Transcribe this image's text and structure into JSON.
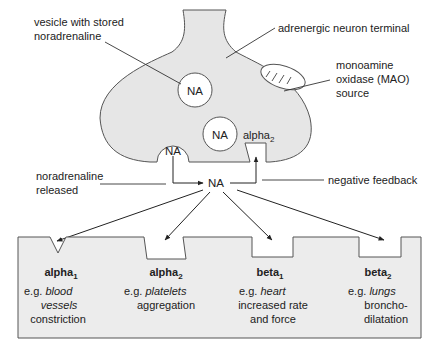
{
  "colors": {
    "fill_gray": "#e6e6e6",
    "stroke": "#555555",
    "text": "#222222",
    "background": "#ffffff"
  },
  "neuron": {
    "terminal_label": "adrenergic neuron terminal",
    "vesicle_label_line1": "vesicle with stored",
    "vesicle_label_line2": "noradrenaline",
    "mao_label_line1": "monoamine",
    "mao_label_line2": "oxidase (MAO)",
    "mao_label_line3": "source",
    "vesicles": [
      {
        "label": "NA"
      },
      {
        "label": "NA"
      },
      {
        "label": "NA"
      }
    ],
    "presynaptic_receptor": {
      "name": "alpha",
      "subscript": "2"
    }
  },
  "synapse": {
    "released_line1": "noradrenaline",
    "released_line2": "released",
    "center_label": "NA",
    "feedback_label": "negative feedback"
  },
  "receptors": [
    {
      "name": "alpha",
      "subscript": "1",
      "eg": "e.g.",
      "tissue_line1": "blood",
      "tissue_line2": "vessels",
      "effect_line1": "constriction",
      "effect_line2": ""
    },
    {
      "name": "alpha",
      "subscript": "2",
      "eg": "e.g.",
      "tissue_line1": "platelets",
      "tissue_line2": "",
      "effect_line1": "aggregation",
      "effect_line2": ""
    },
    {
      "name": "beta",
      "subscript": "1",
      "eg": "e.g.",
      "tissue_line1": "heart",
      "tissue_line2": "",
      "effect_line1": "increased rate",
      "effect_line2": "and force"
    },
    {
      "name": "beta",
      "subscript": "2",
      "eg": "e.g.",
      "tissue_line1": "lungs",
      "tissue_line2": "",
      "effect_line1": "broncho-",
      "effect_line2": "dilatation"
    }
  ]
}
